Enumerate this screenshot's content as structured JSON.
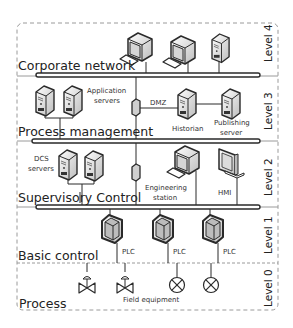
{
  "levels": [
    {
      "id": "level4",
      "label": "Level 4",
      "zone": "Corporate network"
    },
    {
      "id": "level3",
      "label": "Level 3",
      "zone": "Process management"
    },
    {
      "id": "level2",
      "label": "Level 2",
      "zone": "Supervisory Control"
    },
    {
      "id": "level1",
      "label": "Level 1",
      "zone": "Basic control"
    },
    {
      "id": "level0",
      "label": "Level 0",
      "zone": "Process"
    }
  ],
  "labels": {
    "application_servers_1": "Application",
    "application_servers_2": "servers",
    "dmz": "DMZ",
    "historian": "Historian",
    "publishing_1": "Publishing",
    "publishing_2": "server",
    "dcs_1": "DCS",
    "dcs_2": "servers",
    "engineering_1": "Engineering",
    "engineering_2": "station",
    "hmi": "HMI",
    "plc": "PLC",
    "field_equipment": "Field equipment"
  },
  "colors": {
    "line": "#2a2a2a",
    "dashed_border": "#9a9a9a",
    "device_fill": "#e8e8e8",
    "background": "#ffffff"
  }
}
